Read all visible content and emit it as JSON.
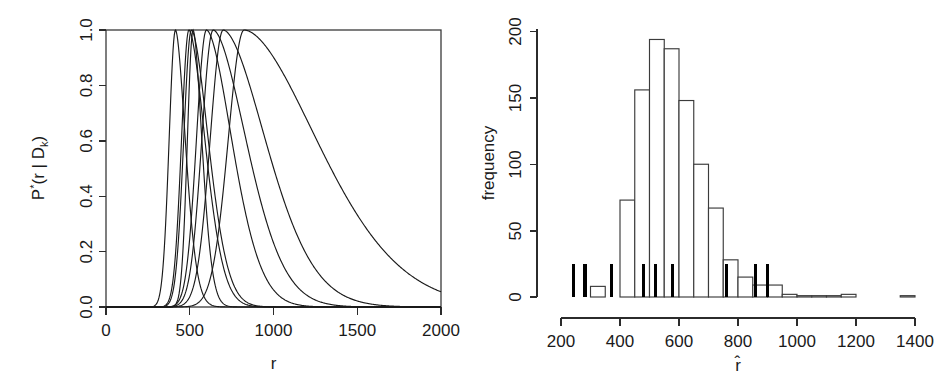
{
  "figure": {
    "panels": [
      "posterior-curves",
      "bootstrap-histogram"
    ],
    "background": "#ffffff",
    "ink_color": "#1a1a1a"
  },
  "chart_data": [
    {
      "id": "posterior-curves",
      "type": "line",
      "title": "",
      "xlabel": "r",
      "ylabel": "P*(r | D_k)",
      "ylabel_parts": {
        "base": "P",
        "superscript": "*",
        "open": "(r | D",
        "subscript": "k",
        "close": ")"
      },
      "xlim": [
        0,
        2000
      ],
      "ylim": [
        0.0,
        1.0
      ],
      "xticks": [
        0,
        500,
        1000,
        1500,
        2000
      ],
      "yticks": [
        0.0,
        0.2,
        0.4,
        0.6,
        0.8,
        1.0
      ],
      "ytick_labels": [
        "0.0",
        "0.2",
        "0.4",
        "0.6",
        "0.8",
        "1.0"
      ],
      "xtick_labels": [
        "0",
        "500",
        "1000",
        "1500",
        "2000"
      ],
      "grid": false,
      "legend": "none",
      "series_note": "seven normalised posterior densities, each scaled to a peak of 1.0",
      "series": [
        {
          "name": "curve-1",
          "peak_r": 415,
          "peak_y": 1.0,
          "left_width": 38,
          "right_width": 58
        },
        {
          "name": "curve-2",
          "peak_r": 495,
          "peak_y": 1.0,
          "left_width": 44,
          "right_width": 95
        },
        {
          "name": "curve-3",
          "peak_r": 510,
          "peak_y": 1.0,
          "left_width": 46,
          "right_width": 100
        },
        {
          "name": "curve-4",
          "peak_r": 520,
          "peak_y": 1.0,
          "left_width": 34,
          "right_width": 52
        },
        {
          "name": "curve-5",
          "peak_r": 600,
          "peak_y": 1.0,
          "left_width": 60,
          "right_width": 150
        },
        {
          "name": "curve-6",
          "peak_r": 640,
          "peak_y": 1.0,
          "left_width": 68,
          "right_width": 195
        },
        {
          "name": "curve-7",
          "peak_r": 700,
          "peak_y": 1.0,
          "left_width": 78,
          "right_width": 250
        },
        {
          "name": "curve-8",
          "peak_r": 825,
          "peak_y": 1.0,
          "left_width": 95,
          "right_width": 430
        }
      ]
    },
    {
      "id": "bootstrap-histogram",
      "type": "bar",
      "title": "",
      "xlabel": "r̂",
      "ylabel": "frequency",
      "xlim": [
        200,
        1400
      ],
      "ylim": [
        0,
        205
      ],
      "xticks": [
        200,
        400,
        600,
        800,
        1000,
        1200,
        1400
      ],
      "xtick_labels": [
        "200",
        "400",
        "600",
        "800",
        "1000",
        "1200",
        "1400"
      ],
      "yticks": [
        0,
        50,
        100,
        150,
        200
      ],
      "ytick_labels": [
        "0",
        "50",
        "100",
        "150",
        "200"
      ],
      "grid": false,
      "legend": "none",
      "bin_width": 50,
      "bin_starts": [
        300,
        350,
        400,
        450,
        500,
        550,
        600,
        650,
        700,
        750,
        800,
        850,
        900,
        950,
        1000,
        1050,
        1100,
        1150,
        1200,
        1250,
        1300,
        1350
      ],
      "values": [
        8,
        0,
        73,
        156,
        194,
        187,
        148,
        100,
        67,
        28,
        15,
        9,
        9,
        2,
        1,
        1,
        1,
        2,
        0,
        0,
        0,
        1
      ],
      "rug": {
        "name": "observed-estimates-rug",
        "height": 25,
        "values": [
          242,
          281,
          372,
          480,
          520,
          578,
          760,
          860,
          900
        ]
      }
    }
  ]
}
